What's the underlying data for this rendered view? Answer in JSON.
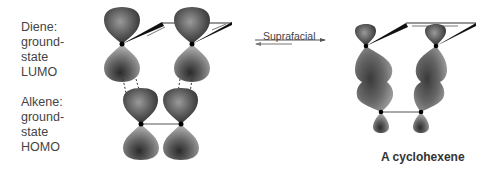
{
  "reactants": {
    "diene": {
      "lines": [
        "Diene:",
        "ground-",
        "state",
        "LUMO"
      ]
    },
    "alkene": {
      "lines": [
        "Alkene:",
        "ground-",
        "state",
        "HOMO"
      ]
    }
  },
  "arrow": {
    "label": "Suprafacial",
    "type": "equilibrium"
  },
  "product": {
    "label": "A cyclohexene"
  },
  "colors": {
    "lobe_dark": "#2e2e2e",
    "lobe_mid": "#6e6e6e",
    "lobe_light": "#b5b5b5",
    "bond": "#111111"
  }
}
